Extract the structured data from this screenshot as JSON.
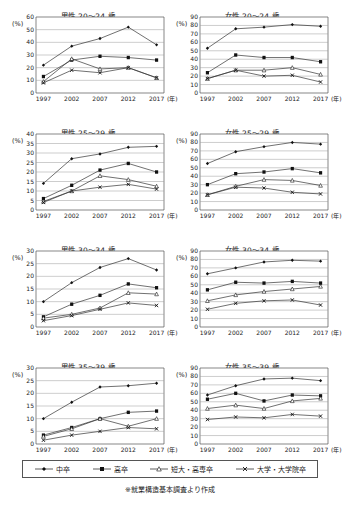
{
  "legend": {
    "items": [
      {
        "label": "中卒",
        "marker": "diamond",
        "name": "legend-item-chusotsu"
      },
      {
        "label": "高卒",
        "marker": "square",
        "name": "legend-item-kousotsu"
      },
      {
        "label": "短大・高専卒",
        "marker": "triangle",
        "name": "legend-item-tandai"
      },
      {
        "label": "大学・大学院卒",
        "marker": "cross",
        "name": "legend-item-daigaku"
      }
    ]
  },
  "source_note": "※就業構造基本調査より作成",
  "axis": {
    "unit_label": "(%)",
    "x_unit_label": "(年)",
    "categories": [
      "1997",
      "2002",
      "2007",
      "2012",
      "2017"
    ]
  },
  "chart_data": [
    {
      "type": "line",
      "title": "男性 20～24 歳",
      "xlabel": "(年)",
      "ylabel": "(%)",
      "x": [
        "1997",
        "2002",
        "2007",
        "2012",
        "2017"
      ],
      "ylim": [
        0,
        60
      ],
      "yticks": [
        0,
        10,
        20,
        30,
        40,
        50,
        60
      ],
      "grid": true,
      "legend_position": "bottom-shared",
      "series": [
        {
          "name": "中卒",
          "marker": "diamond",
          "values": [
            22,
            37,
            43,
            52,
            38
          ]
        },
        {
          "name": "高卒",
          "marker": "square",
          "values": [
            13,
            26,
            29,
            28,
            26
          ]
        },
        {
          "name": "短大・高専卒",
          "marker": "triangle",
          "values": [
            9,
            27,
            19,
            20,
            12
          ]
        },
        {
          "name": "大学・大学院卒",
          "marker": "cross",
          "values": [
            8,
            18,
            16,
            20,
            12
          ]
        }
      ]
    },
    {
      "type": "line",
      "title": "女性 20～24 歳",
      "xlabel": "(年)",
      "ylabel": "(%)",
      "x": [
        "1997",
        "2002",
        "2007",
        "2012",
        "2017"
      ],
      "ylim": [
        0,
        90
      ],
      "yticks": [
        0,
        10,
        20,
        30,
        40,
        50,
        60,
        70,
        80,
        90
      ],
      "grid": true,
      "legend_position": "bottom-shared",
      "series": [
        {
          "name": "中卒",
          "marker": "diamond",
          "values": [
            53,
            76,
            78,
            81,
            79
          ]
        },
        {
          "name": "高卒",
          "marker": "square",
          "values": [
            24,
            45,
            42,
            42,
            37
          ]
        },
        {
          "name": "短大・高専卒",
          "marker": "triangle",
          "values": [
            17,
            27,
            27,
            30,
            22
          ]
        },
        {
          "name": "大学・大学院卒",
          "marker": "cross",
          "values": [
            17,
            27,
            20,
            21,
            13
          ]
        }
      ]
    },
    {
      "type": "line",
      "title": "男性 25～29 歳",
      "xlabel": "(年)",
      "ylabel": "(%)",
      "x": [
        "1997",
        "2002",
        "2007",
        "2012",
        "2017"
      ],
      "ylim": [
        0,
        40
      ],
      "yticks": [
        0,
        5,
        10,
        15,
        20,
        25,
        30,
        35,
        40
      ],
      "grid": true,
      "legend_position": "bottom-shared",
      "series": [
        {
          "name": "中卒",
          "marker": "diamond",
          "values": [
            14,
            27,
            29.5,
            33,
            33.5
          ]
        },
        {
          "name": "高卒",
          "marker": "square",
          "values": [
            6,
            13,
            21,
            24.5,
            20
          ]
        },
        {
          "name": "短大・高専卒",
          "marker": "triangle",
          "values": [
            4.5,
            10,
            18,
            16,
            12.5
          ]
        },
        {
          "name": "大学・大学院卒",
          "marker": "cross",
          "values": [
            4,
            10,
            12,
            13.5,
            11
          ]
        }
      ]
    },
    {
      "type": "line",
      "title": "女性 25～29 歳",
      "xlabel": "(年)",
      "ylabel": "(%)",
      "x": [
        "1997",
        "2002",
        "2007",
        "2012",
        "2017"
      ],
      "ylim": [
        0,
        90
      ],
      "yticks": [
        0,
        10,
        20,
        30,
        40,
        50,
        60,
        70,
        80,
        90
      ],
      "grid": true,
      "legend_position": "bottom-shared",
      "series": [
        {
          "name": "中卒",
          "marker": "diamond",
          "values": [
            55,
            69,
            75,
            80,
            78
          ]
        },
        {
          "name": "高卒",
          "marker": "square",
          "values": [
            30,
            43,
            45,
            49,
            44
          ]
        },
        {
          "name": "短大・高専卒",
          "marker": "triangle",
          "values": [
            18,
            28,
            36,
            35,
            29
          ]
        },
        {
          "name": "大学・大学院卒",
          "marker": "cross",
          "values": [
            18,
            27,
            26,
            21,
            19
          ]
        }
      ]
    },
    {
      "type": "line",
      "title": "男性 30～34 歳",
      "xlabel": "(年)",
      "ylabel": "(%)",
      "x": [
        "1997",
        "2002",
        "2007",
        "2012",
        "2017"
      ],
      "ylim": [
        0,
        30
      ],
      "yticks": [
        0,
        5,
        10,
        15,
        20,
        25,
        30
      ],
      "grid": true,
      "legend_position": "bottom-shared",
      "series": [
        {
          "name": "中卒",
          "marker": "diamond",
          "values": [
            10,
            17.5,
            23.5,
            27,
            22.5
          ]
        },
        {
          "name": "高卒",
          "marker": "square",
          "values": [
            4,
            9,
            12.5,
            17,
            15.5
          ]
        },
        {
          "name": "短大・高専卒",
          "marker": "triangle",
          "values": [
            3.5,
            5,
            7.5,
            13.5,
            13
          ]
        },
        {
          "name": "大学・大学院卒",
          "marker": "cross",
          "values": [
            2.5,
            4.5,
            7,
            9.5,
            8.5
          ]
        }
      ]
    },
    {
      "type": "line",
      "title": "女性 30～34 歳",
      "xlabel": "(年)",
      "ylabel": "(%)",
      "x": [
        "1997",
        "2002",
        "2007",
        "2012",
        "2017"
      ],
      "ylim": [
        0,
        90
      ],
      "yticks": [
        0,
        10,
        20,
        30,
        40,
        50,
        60,
        70,
        80,
        90
      ],
      "grid": true,
      "legend_position": "bottom-shared",
      "series": [
        {
          "name": "中卒",
          "marker": "diamond",
          "values": [
            63,
            70,
            77,
            79,
            78
          ]
        },
        {
          "name": "高卒",
          "marker": "square",
          "values": [
            44,
            53,
            52,
            54,
            52
          ]
        },
        {
          "name": "短大・高専卒",
          "marker": "triangle",
          "values": [
            31,
            38,
            42,
            45,
            48
          ]
        },
        {
          "name": "大学・大学院卒",
          "marker": "cross",
          "values": [
            21,
            28,
            31,
            32,
            26
          ]
        }
      ]
    },
    {
      "type": "line",
      "title": "男性 35～39 歳",
      "xlabel": "(年)",
      "ylabel": "(%)",
      "x": [
        "1997",
        "2002",
        "2007",
        "2012",
        "2017"
      ],
      "ylim": [
        0,
        30
      ],
      "yticks": [
        0,
        5,
        10,
        15,
        20,
        25,
        30
      ],
      "grid": true,
      "legend_position": "bottom-shared",
      "series": [
        {
          "name": "中卒",
          "marker": "diamond",
          "values": [
            10,
            16.5,
            22.5,
            23,
            24
          ]
        },
        {
          "name": "高卒",
          "marker": "square",
          "values": [
            3.5,
            6.5,
            10,
            12.5,
            13
          ]
        },
        {
          "name": "短大・高専卒",
          "marker": "triangle",
          "values": [
            3,
            6,
            10,
            7,
            10
          ]
        },
        {
          "name": "大学・大学院卒",
          "marker": "cross",
          "values": [
            1.5,
            3.5,
            5,
            6.5,
            6
          ]
        }
      ]
    },
    {
      "type": "line",
      "title": "女性 35～39 歳",
      "xlabel": "(年)",
      "ylabel": "(%)",
      "x": [
        "1997",
        "2002",
        "2007",
        "2012",
        "2017"
      ],
      "ylim": [
        0,
        90
      ],
      "yticks": [
        0,
        10,
        20,
        30,
        40,
        50,
        60,
        70,
        80,
        90
      ],
      "grid": true,
      "legend_position": "bottom-shared",
      "series": [
        {
          "name": "中卒",
          "marker": "diamond",
          "values": [
            58,
            69,
            77,
            78,
            75
          ]
        },
        {
          "name": "高卒",
          "marker": "square",
          "values": [
            53,
            60,
            51,
            58,
            57
          ]
        },
        {
          "name": "短大・高専卒",
          "marker": "triangle",
          "values": [
            42,
            46,
            42,
            51,
            54
          ]
        },
        {
          "name": "大学・大学院卒",
          "marker": "cross",
          "values": [
            29,
            32,
            31,
            35,
            33
          ]
        }
      ]
    }
  ]
}
